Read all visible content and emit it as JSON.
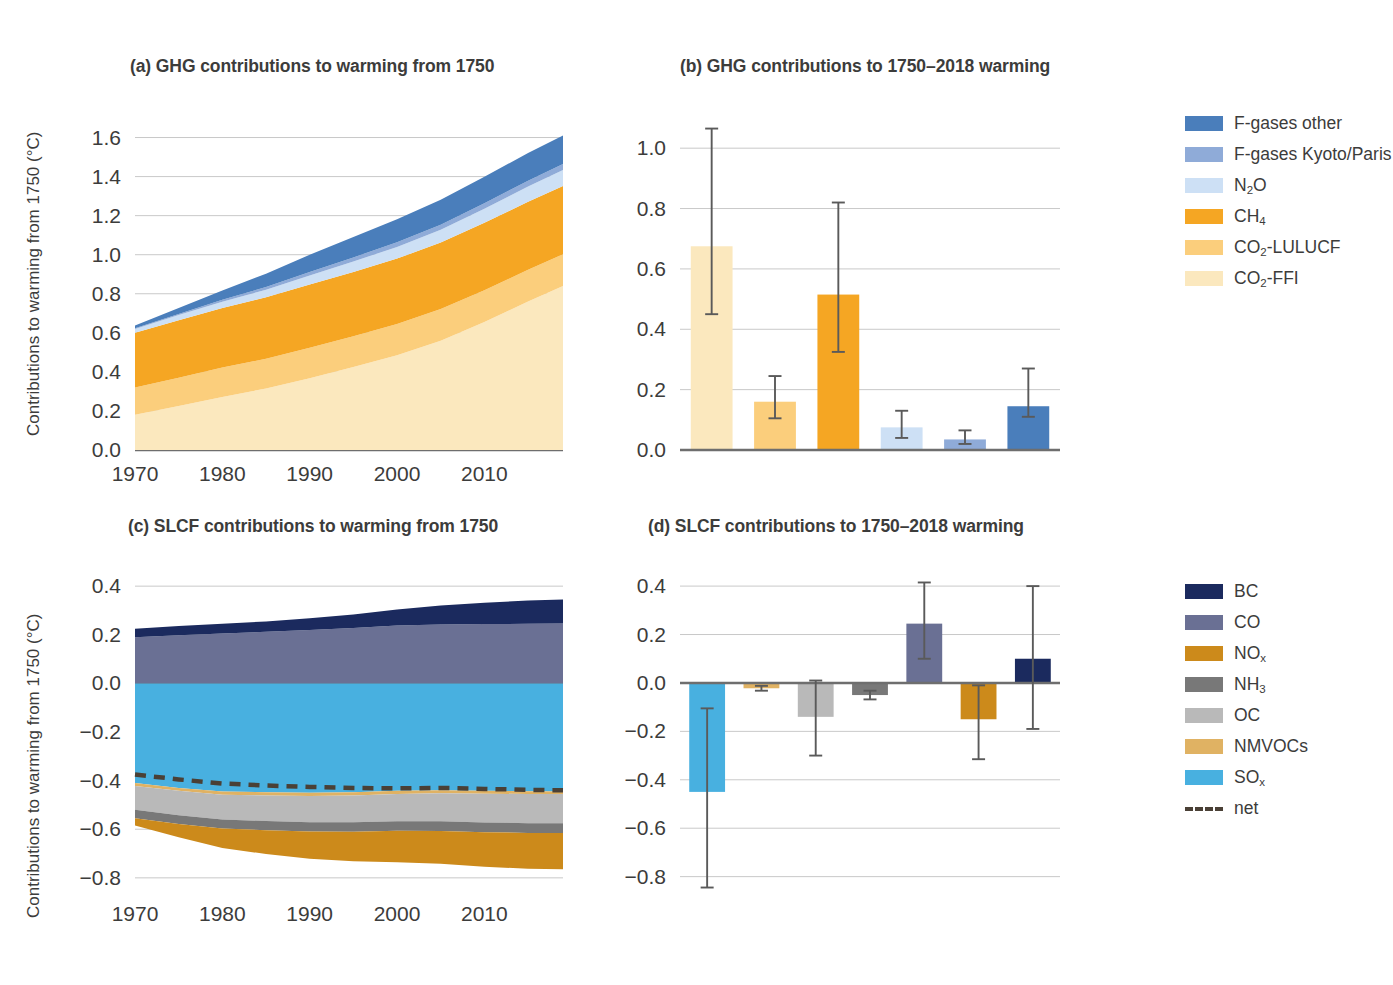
{
  "figure": {
    "panels": {
      "a": "(a) GHG contributions to warming from 1750",
      "b": "(b) GHG contributions to 1750–2018 warming",
      "c": "(c) SLCF contributions to warming from 1750",
      "d": "(d) SLCF contributions to 1750–2018 warming"
    },
    "ylabel": "Contributions to warming from 1750 (°C)"
  },
  "legends": {
    "ghg": {
      "items": [
        {
          "label": "F-gases other",
          "color": "#4a7ebb",
          "sub": ""
        },
        {
          "label": "F-gases Kyoto/Paris",
          "color": "#8fabd8",
          "sub": ""
        },
        {
          "label": "N",
          "sub": "2",
          "tail": "O",
          "color": "#cde0f5"
        },
        {
          "label": "CH",
          "sub": "4",
          "tail": "",
          "color": "#f5a623"
        },
        {
          "label": "CO",
          "sub": "2",
          "tail": "-LULUCF",
          "color": "#fbce7c"
        },
        {
          "label": "CO",
          "sub": "2",
          "tail": "-FFI",
          "color": "#fbe8be"
        }
      ]
    },
    "slcf": {
      "items": [
        {
          "label": "BC",
          "sub": "",
          "tail": "",
          "color": "#1b2a5e"
        },
        {
          "label": "CO",
          "sub": "",
          "tail": "",
          "color": "#6a7094"
        },
        {
          "label": "NO",
          "sub": "x",
          "tail": "",
          "color": "#cc8a1b"
        },
        {
          "label": "NH",
          "sub": "3",
          "tail": "",
          "color": "#787878"
        },
        {
          "label": "OC",
          "sub": "",
          "tail": "",
          "color": "#b9b9b9"
        },
        {
          "label": "NMVOCs",
          "sub": "",
          "tail": "",
          "color": "#e0b263"
        },
        {
          "label": "SO",
          "sub": "x",
          "tail": "",
          "color": "#48b0e0"
        },
        {
          "label": "net",
          "sub": "",
          "tail": "",
          "color": "#4a4036",
          "dashed": true
        }
      ]
    }
  },
  "chart_data": [
    {
      "id": "a",
      "type": "area",
      "title": "(a) GHG contributions to warming from 1750",
      "xlabel": "",
      "ylabel": "Contributions to warming from 1750 (°C)",
      "xlim": [
        1970,
        2019
      ],
      "ylim": [
        0.0,
        1.7
      ],
      "yticks": [
        0.0,
        0.2,
        0.4,
        0.6,
        0.8,
        1.0,
        1.2,
        1.4,
        1.6
      ],
      "ytick_labels": [
        "0.0",
        "0.2",
        "0.4",
        "0.6",
        "0.8",
        "1.0",
        "1.2",
        "1.4",
        "1.6"
      ],
      "xticks": [
        1970,
        1980,
        1990,
        2000,
        2010
      ],
      "xtick_labels": [
        "1970",
        "1980",
        "1990",
        "2000",
        "2010"
      ],
      "grid": true,
      "legend_position": "right",
      "stack_order_bottom_to_top": [
        "CO2-FFI",
        "CO2-LULUCF",
        "CH4",
        "N2O",
        "F-gases Kyoto/Paris",
        "F-gases other"
      ],
      "x": [
        1970,
        1975,
        1980,
        1985,
        1990,
        1995,
        2000,
        2005,
        2010,
        2015,
        2019
      ],
      "series": [
        {
          "name": "CO2-FFI",
          "color": "#fbe8be",
          "values": [
            0.18,
            0.225,
            0.272,
            0.315,
            0.368,
            0.425,
            0.485,
            0.56,
            0.655,
            0.76,
            0.84
          ]
        },
        {
          "name": "CO2-LULUCF",
          "color": "#fbce7c",
          "values": [
            0.14,
            0.145,
            0.15,
            0.152,
            0.155,
            0.157,
            0.16,
            0.162,
            0.163,
            0.163,
            0.162
          ]
        },
        {
          "name": "CH4",
          "color": "#f5a623",
          "values": [
            0.28,
            0.295,
            0.305,
            0.315,
            0.325,
            0.33,
            0.335,
            0.34,
            0.345,
            0.348,
            0.35
          ]
        },
        {
          "name": "N2O",
          "color": "#cde0f5",
          "values": [
            0.02,
            0.026,
            0.032,
            0.039,
            0.046,
            0.053,
            0.06,
            0.066,
            0.072,
            0.078,
            0.082
          ]
        },
        {
          "name": "F-gases Kyoto/Paris",
          "color": "#8fabd8",
          "values": [
            0.003,
            0.006,
            0.01,
            0.014,
            0.018,
            0.021,
            0.024,
            0.026,
            0.028,
            0.03,
            0.031
          ]
        },
        {
          "name": "F-gases other",
          "color": "#4a7ebb",
          "values": [
            0.015,
            0.03,
            0.048,
            0.068,
            0.088,
            0.105,
            0.118,
            0.128,
            0.136,
            0.142,
            0.146
          ]
        }
      ]
    },
    {
      "id": "b",
      "type": "bar",
      "title": "(b) GHG contributions to 1750–2018 warming",
      "xlabel": "",
      "ylabel": "",
      "ylim": [
        0.0,
        1.1
      ],
      "yticks": [
        0.0,
        0.2,
        0.4,
        0.6,
        0.8,
        1.0
      ],
      "ytick_labels": [
        "0.0",
        "0.2",
        "0.4",
        "0.6",
        "0.8",
        "1.0"
      ],
      "grid": true,
      "categories": [
        "CO2-FFI",
        "CO2-LULUCF",
        "CH4",
        "N2O",
        "F-gases Kyoto/Paris",
        "F-gases other"
      ],
      "colors": [
        "#fbe8be",
        "#fbce7c",
        "#f5a623",
        "#cde0f5",
        "#8fabd8",
        "#4a7ebb"
      ],
      "values": [
        0.675,
        0.16,
        0.515,
        0.075,
        0.035,
        0.145
      ],
      "err_low": [
        0.45,
        0.105,
        0.325,
        0.04,
        0.02,
        0.11
      ],
      "err_high": [
        1.065,
        0.245,
        0.82,
        0.13,
        0.065,
        0.27
      ]
    },
    {
      "id": "c",
      "type": "area",
      "title": "(c) SLCF contributions to warming from 1750",
      "xlabel": "",
      "ylabel": "Contributions to warming from 1750 (°C)",
      "xlim": [
        1970,
        2019
      ],
      "ylim": [
        -0.85,
        0.45
      ],
      "yticks": [
        0.4,
        0.2,
        0.0,
        -0.2,
        -0.4,
        -0.6,
        -0.8
      ],
      "ytick_labels": [
        "0.4",
        "0.2",
        "0.0",
        "−0.2",
        "−0.4",
        "−0.6",
        "−0.8"
      ],
      "xticks": [
        1970,
        1980,
        1990,
        2000,
        2010
      ],
      "xtick_labels": [
        "1970",
        "1980",
        "1990",
        "2000",
        "2010"
      ],
      "grid": true,
      "legend_position": "right",
      "x": [
        1970,
        1975,
        1980,
        1985,
        1990,
        1995,
        2000,
        2005,
        2010,
        2015,
        2019
      ],
      "positive_stack_bottom_to_top": [
        "CO",
        "BC"
      ],
      "negative_stack_top_to_bottom": [
        "SOx",
        "NMVOCs",
        "OC",
        "NH3",
        "NOx"
      ],
      "series": [
        {
          "name": "CO",
          "color": "#6a7094",
          "sign": "positive",
          "values": [
            0.19,
            0.198,
            0.205,
            0.212,
            0.22,
            0.228,
            0.238,
            0.242,
            0.244,
            0.245,
            0.246
          ]
        },
        {
          "name": "BC",
          "color": "#1b2a5e",
          "sign": "positive",
          "values": [
            0.035,
            0.038,
            0.04,
            0.043,
            0.048,
            0.055,
            0.066,
            0.078,
            0.088,
            0.096,
            0.099
          ]
        },
        {
          "name": "SOx",
          "color": "#48b0e0",
          "sign": "negative",
          "values": [
            -0.41,
            -0.43,
            -0.445,
            -0.448,
            -0.45,
            -0.448,
            -0.442,
            -0.44,
            -0.442,
            -0.444,
            -0.445
          ]
        },
        {
          "name": "NMVOCs",
          "color": "#e0b263",
          "sign": "negative",
          "values": [
            -0.012,
            -0.012,
            -0.013,
            -0.013,
            -0.013,
            -0.013,
            -0.013,
            -0.012,
            -0.012,
            -0.011,
            -0.01
          ]
        },
        {
          "name": "OC",
          "color": "#b9b9b9",
          "sign": "negative",
          "values": [
            -0.098,
            -0.1,
            -0.102,
            -0.105,
            -0.108,
            -0.11,
            -0.112,
            -0.115,
            -0.118,
            -0.12,
            -0.12
          ]
        },
        {
          "name": "NH3",
          "color": "#787878",
          "sign": "negative",
          "values": [
            -0.035,
            -0.036,
            -0.037,
            -0.038,
            -0.038,
            -0.039,
            -0.039,
            -0.04,
            -0.04,
            -0.04,
            -0.04
          ]
        },
        {
          "name": "NOx",
          "color": "#cc8a1b",
          "sign": "negative",
          "values": [
            -0.03,
            -0.055,
            -0.08,
            -0.098,
            -0.112,
            -0.122,
            -0.13,
            -0.135,
            -0.142,
            -0.148,
            -0.15
          ]
        }
      ],
      "net": {
        "name": "net",
        "color": "#4a4036",
        "dashed": true,
        "values": [
          -0.375,
          -0.395,
          -0.412,
          -0.42,
          -0.426,
          -0.43,
          -0.432,
          -0.43,
          -0.434,
          -0.438,
          -0.44
        ]
      }
    },
    {
      "id": "d",
      "type": "bar",
      "title": "(d) SLCF contributions to 1750–2018 warming",
      "xlabel": "",
      "ylabel": "",
      "ylim": [
        -0.88,
        0.45
      ],
      "yticks": [
        0.4,
        0.2,
        0.0,
        -0.2,
        -0.4,
        -0.6,
        -0.8
      ],
      "ytick_labels": [
        "0.4",
        "0.2",
        "0.0",
        "−0.2",
        "−0.4",
        "−0.6",
        "−0.8"
      ],
      "grid": true,
      "categories": [
        "SOx",
        "NMVOCs",
        "OC",
        "NH3",
        "CO",
        "NOx",
        "BC"
      ],
      "colors": [
        "#48b0e0",
        "#e0b263",
        "#b9b9b9",
        "#787878",
        "#6a7094",
        "#cc8a1b",
        "#1b2a5e"
      ],
      "values": [
        -0.45,
        -0.022,
        -0.14,
        -0.05,
        0.245,
        -0.15,
        0.1
      ],
      "err_low": [
        -0.845,
        -0.032,
        -0.3,
        -0.068,
        0.1,
        -0.315,
        -0.19
      ],
      "err_high": [
        -0.105,
        -0.012,
        0.01,
        -0.032,
        0.415,
        -0.01,
        0.4
      ]
    }
  ]
}
